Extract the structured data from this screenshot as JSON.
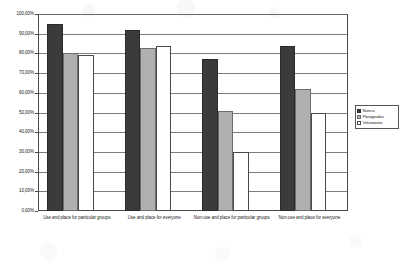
{
  "chart_data": {
    "type": "bar",
    "title": "",
    "subtitle": "",
    "xlabel": "",
    "ylabel": "",
    "ylim": [
      0,
      100
    ],
    "grid": true,
    "legend_position": "right",
    "categories": [
      "Use and place for particular groups",
      "Use and place for everyone",
      "Non-use and place for particular groups",
      "Non-use and place for everyone"
    ],
    "ytick_labels": [
      "100,00%",
      "90,00%",
      "80,00%",
      "70,00%",
      "60,00%",
      "50,00%",
      "40,00%",
      "30,00%",
      "20,00%",
      "10,00%",
      "0,00%"
    ],
    "ytick_values": [
      100,
      90,
      80,
      70,
      60,
      50,
      40,
      30,
      20,
      10,
      0
    ],
    "series": [
      {
        "name": "Nunca",
        "color": "#3b3b3b",
        "values": [
          95,
          92,
          77,
          84
        ]
      },
      {
        "name": "Planypudas",
        "color": "#b0b0b0",
        "values": [
          80,
          83,
          51,
          62
        ]
      },
      {
        "name": "Voluntarios",
        "color": "#ffffff",
        "values": [
          79,
          84,
          30,
          50
        ]
      }
    ]
  },
  "legend": {
    "entries": [
      {
        "label": "Nunca"
      },
      {
        "label": "Planypudas"
      },
      {
        "label": "Voluntarios"
      }
    ]
  }
}
